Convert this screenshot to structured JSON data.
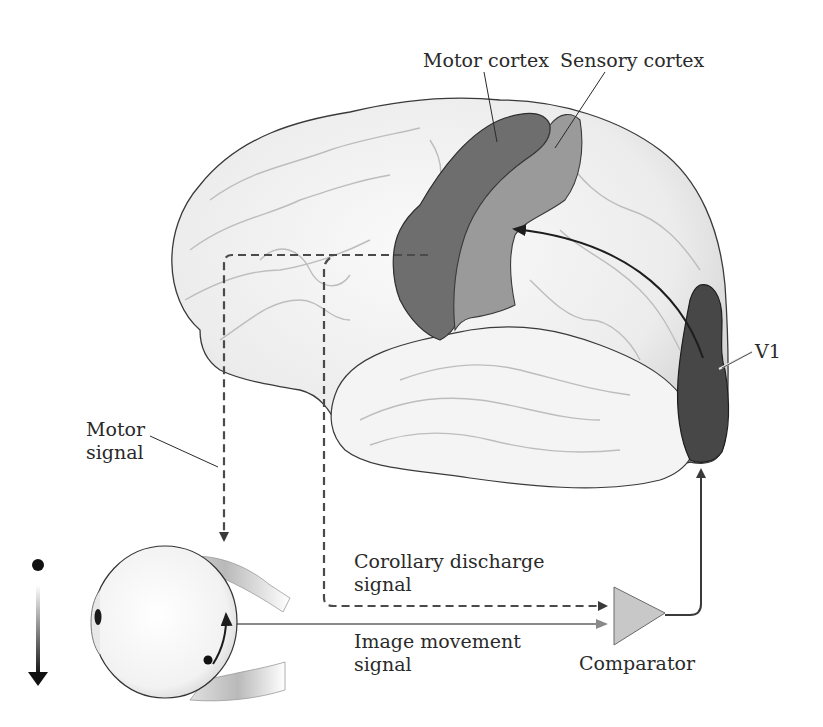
{
  "diagram": {
    "labels": {
      "motor_cortex": "Motor cortex",
      "sensory_cortex": "Sensory cortex",
      "v1": "V1",
      "motor_signal_line1": "Motor",
      "motor_signal_line2": "signal",
      "corollary_line1": "Corollary discharge",
      "corollary_line2": "signal",
      "image_movement_line1": "Image movement",
      "image_movement_line2": "signal",
      "comparator": "Comparator"
    },
    "nodes": [
      {
        "id": "brain",
        "label": "Brain (lateral view)"
      },
      {
        "id": "motor_cortex",
        "label": "Motor cortex",
        "color": "#6e6e6e"
      },
      {
        "id": "sensory_cortex",
        "label": "Sensory cortex",
        "color": "#9a9a9a"
      },
      {
        "id": "v1",
        "label": "V1",
        "color": "#474747"
      },
      {
        "id": "eye",
        "label": "Eye"
      },
      {
        "id": "comparator",
        "label": "Comparator",
        "color": "#c8c8c8"
      }
    ],
    "edges": [
      {
        "from": "motor_cortex",
        "to": "eye",
        "label": "Motor signal",
        "style": "dashed"
      },
      {
        "from": "motor_cortex",
        "to": "comparator",
        "label": "Corollary discharge signal",
        "style": "dashed"
      },
      {
        "from": "eye",
        "to": "comparator",
        "label": "Image movement signal",
        "style": "solid-gray"
      },
      {
        "from": "comparator",
        "to": "v1",
        "label": "",
        "style": "solid"
      },
      {
        "from": "v1",
        "to": "sensory_cortex",
        "label": "",
        "style": "solid-curved"
      }
    ],
    "colors": {
      "brain_fill": "#f1f1f1",
      "brain_outline": "#3a3a3a",
      "motor_cortex": "#6e6e6e",
      "sensory_cortex": "#9a9a9a",
      "v1": "#474747",
      "dashed_line": "#4a4a4a",
      "image_line": "#8a8a8a",
      "comparator": "#c8c8c8"
    }
  }
}
